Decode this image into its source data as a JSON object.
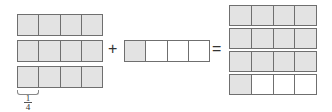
{
  "colors": {
    "shaded": "#e3e3e3",
    "unshaded": "#ffffff",
    "border": "#6f6f6f"
  },
  "left_group": {
    "bars": [
      {
        "cells": [
          1,
          1,
          1,
          1
        ]
      },
      {
        "cells": [
          1,
          1,
          1,
          1
        ]
      },
      {
        "cells": [
          1,
          1,
          1,
          1
        ]
      }
    ],
    "label": {
      "numerator": "1",
      "denominator": "4"
    }
  },
  "operator_plus": "+",
  "middle_group": {
    "bars": [
      {
        "cells": [
          1,
          0,
          0,
          0
        ]
      }
    ]
  },
  "operator_equals": "=",
  "right_group": {
    "bars": [
      {
        "cells": [
          1,
          1,
          1,
          1
        ]
      },
      {
        "cells": [
          1,
          1,
          1,
          1
        ]
      },
      {
        "cells": [
          1,
          1,
          1,
          1
        ]
      },
      {
        "cells": [
          1,
          0,
          0,
          0
        ]
      }
    ]
  }
}
